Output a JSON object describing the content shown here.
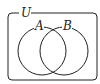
{
  "diagram": {
    "type": "venn",
    "universe_label": "U",
    "sets": [
      {
        "label": "A"
      },
      {
        "label": "B"
      }
    ],
    "colors": {
      "stroke": "#222222",
      "background": "#ffffff"
    }
  }
}
